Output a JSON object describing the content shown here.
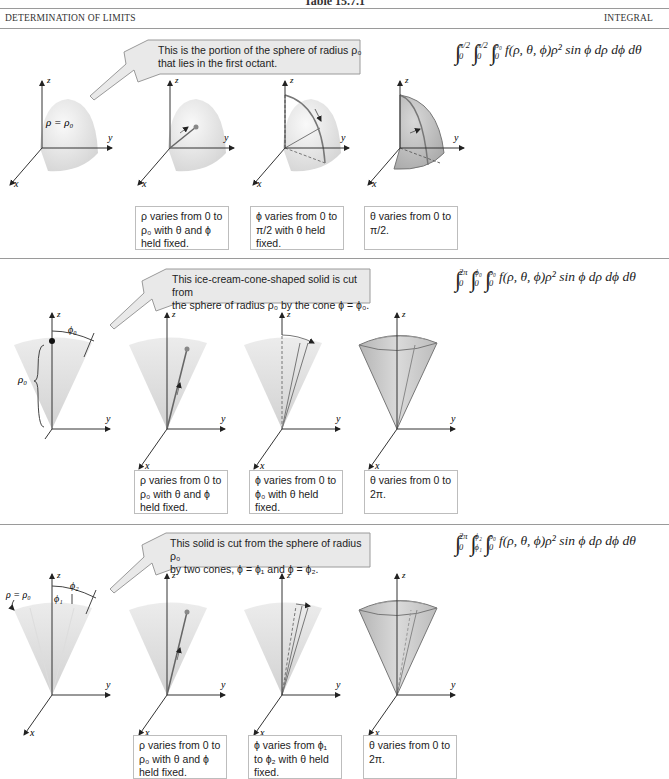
{
  "table_title": "Table 15.7.1",
  "header": {
    "left": "DETERMINATION OF LIMITS",
    "right": "INTEGRAL"
  },
  "rows": [
    {
      "callout": "This is the portion of the sphere of radius ρ₀ that lies in the first octant.",
      "callout_line1": "This is the portion of the sphere of radius ρ₀",
      "callout_line2": "that lies in the first octant.",
      "integral": {
        "limits": [
          {
            "upper": "π/2",
            "lower": "0"
          },
          {
            "upper": "π/2",
            "lower": "0"
          },
          {
            "upper": "ρ₀",
            "lower": "0"
          }
        ],
        "integrand": "f(ρ, θ, ϕ)ρ² sin ϕ dρ dϕ dθ"
      },
      "figure_labels": {
        "solid": "ρ = ρ₀",
        "axis_x": "x",
        "axis_y": "y",
        "axis_z": "z"
      },
      "steps": [
        {
          "l1": "ρ varies from 0 to",
          "l2": "ρ₀ with θ and ϕ",
          "l3": "held fixed."
        },
        {
          "l1": "ϕ varies from 0 to",
          "l2": "π/2 with θ held",
          "l3": "fixed."
        },
        {
          "l1": "θ varies from 0 to",
          "l2": "π/2.",
          "l3": ""
        }
      ]
    },
    {
      "callout_line1": "This ice-cream-cone-shaped solid is cut from",
      "callout_line2": "the sphere of radius ρ₀ by the cone ϕ = ϕ₀.",
      "integral": {
        "limits": [
          {
            "upper": "2π",
            "lower": "0"
          },
          {
            "upper": "ϕ₀",
            "lower": "0"
          },
          {
            "upper": "ρ₀",
            "lower": "0"
          }
        ],
        "integrand": "f(ρ, θ, ϕ)ρ² sin ϕ dρ dϕ dθ"
      },
      "figure_labels": {
        "angle": "ϕ₀",
        "radius": "ρ₀",
        "axis_x": "x",
        "axis_y": "y",
        "axis_z": "z"
      },
      "steps": [
        {
          "l1": "ρ varies from 0 to",
          "l2": "ρ₀ with θ and ϕ",
          "l3": "held fixed."
        },
        {
          "l1": "ϕ varies from 0 to",
          "l2": "ϕ₀ with θ held",
          "l3": "fixed."
        },
        {
          "l1": "θ varies from 0 to",
          "l2": "2π.",
          "l3": ""
        }
      ]
    },
    {
      "callout_line1": "This solid is cut from the sphere of radius ρ₀",
      "callout_line2": "by two cones, ϕ = ϕ₁ and ϕ = ϕ₂.",
      "integral": {
        "limits": [
          {
            "upper": "2π",
            "lower": "0"
          },
          {
            "upper": "ϕ₂",
            "lower": "ϕ₁"
          },
          {
            "upper": "ρ₀",
            "lower": "0"
          }
        ],
        "integrand": "f(ρ, θ, ϕ)ρ² sin ϕ dρ dϕ dθ"
      },
      "figure_labels": {
        "solid": "ρ = ρ₀",
        "angle1": "ϕ₁",
        "angle2": "ϕ₂",
        "axis_x": "x",
        "axis_y": "y",
        "axis_z": "z"
      },
      "steps": [
        {
          "l1": "ρ varies from 0 to",
          "l2": "ρ₀ with θ and ϕ",
          "l3": "held fixed."
        },
        {
          "l1": "ϕ varies from ϕ₁",
          "l2": "to ϕ₂ with θ held",
          "l3": "fixed."
        },
        {
          "l1": "θ varies from 0 to",
          "l2": "2π.",
          "l3": ""
        }
      ]
    }
  ],
  "colors": {
    "rule": "#9a9a9a",
    "callout_fill": "#e9e9e9",
    "solid_light": "#ececec",
    "solid_dark": "#bdbdbd",
    "box_border": "#bdbdbd"
  }
}
